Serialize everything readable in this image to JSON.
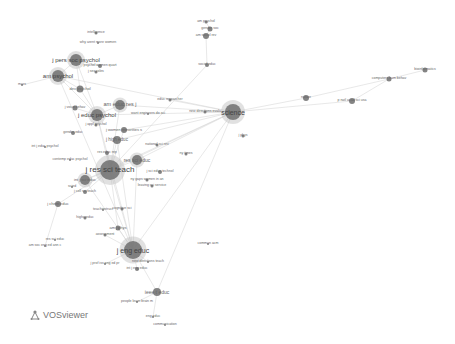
{
  "chart_data": {
    "type": "network",
    "title": "",
    "tool": "VOSviewer",
    "colors": {
      "node": "#6e6e6e",
      "node_light": "#bdbdbd",
      "edge": "#d9d9d9",
      "label": "#555555"
    },
    "nodes": [
      {
        "id": "am_psychol_top",
        "label": "am psychol",
        "x": 206,
        "y": 22,
        "r": 1.5,
        "fs": 3.5
      },
      {
        "id": "gender_soc",
        "label": "gender soc",
        "x": 210,
        "y": 29,
        "r": 2.5,
        "fs": 3.5
      },
      {
        "id": "intelligence",
        "label": "intelligence",
        "x": 96,
        "y": 33,
        "r": 1.5,
        "fs": 3.5
      },
      {
        "id": "am_sociol_rev",
        "label": "am sociol rev",
        "x": 206,
        "y": 36,
        "r": 3,
        "fs": 3.5
      },
      {
        "id": "why_arent_more_women",
        "label": "why arent more women",
        "x": 98,
        "y": 43,
        "r": 1,
        "fs": 3.5
      },
      {
        "id": "j_pers_soc_psychol",
        "label": "j pers soc psychol",
        "x": 76,
        "y": 60,
        "r": 6,
        "fs": 6
      },
      {
        "id": "psychol_women_quart",
        "label": "psychol women quart",
        "x": 100,
        "y": 66,
        "r": 2,
        "fs": 3.5
      },
      {
        "id": "sociol_educ",
        "label": "sociol educ",
        "x": 207,
        "y": 65,
        "r": 2,
        "fs": 3.5
      },
      {
        "id": "sex_roles",
        "label": "j sex roles",
        "x": 96,
        "y": 72,
        "r": 1.5,
        "fs": 3.5
      },
      {
        "id": "am_psychol",
        "label": "am psychol",
        "x": 58,
        "y": 76,
        "r": 6,
        "fs": 6
      },
      {
        "id": "mars",
        "label": "mars",
        "x": 22,
        "y": 85,
        "r": 1,
        "fs": 3.5
      },
      {
        "id": "dev_psychol",
        "label": "dev psychol",
        "x": 80,
        "y": 89,
        "r": 3.5,
        "fs": 4
      },
      {
        "id": "am_educ_res_j",
        "label": "am educ res j",
        "x": 120,
        "y": 105,
        "r": 5,
        "fs": 5.5
      },
      {
        "id": "educ_researcher",
        "label": "educ researcher",
        "x": 170,
        "y": 100,
        "r": 1.5,
        "fs": 3.5
      },
      {
        "id": "science",
        "label": "science",
        "x": 233,
        "y": 112,
        "r": 8,
        "fs": 7
      },
      {
        "id": "j_vocat_behav",
        "label": "j vocat behav",
        "x": 75,
        "y": 108,
        "r": 2.5,
        "fs": 3.5
      },
      {
        "id": "j_educ_psychol",
        "label": "j educ psychol",
        "x": 97,
        "y": 115,
        "r": 6,
        "fs": 6
      },
      {
        "id": "new_directions_eval",
        "label": "new directions evalu",
        "x": 205,
        "y": 112,
        "r": 1.5,
        "fs": 3.5
      },
      {
        "id": "want_engineers_do_sci",
        "label": "want engineers do sci",
        "x": 148,
        "y": 114,
        "r": 1,
        "fs": 3.5
      },
      {
        "id": "j_appl_psychol",
        "label": "j appl psychol",
        "x": 96,
        "y": 125,
        "r": 1.5,
        "fs": 3.5
      },
      {
        "id": "j_women_minorities",
        "label": "j women minorities s",
        "x": 124,
        "y": 130,
        "r": 3,
        "fs": 4
      },
      {
        "id": "gender_educ",
        "label": "gender educ",
        "x": 73,
        "y": 133,
        "r": 2,
        "fs": 3.5
      },
      {
        "id": "j_high_educ",
        "label": "j high educ",
        "x": 117,
        "y": 140,
        "r": 4,
        "fs": 4.5
      },
      {
        "id": "national_sci_rev",
        "label": "national sci rev",
        "x": 157,
        "y": 145,
        "r": 1.5,
        "fs": 3.5
      },
      {
        "id": "int_j_educ_psychol",
        "label": "int j educ psychol",
        "x": 45,
        "y": 147,
        "r": 1,
        "fs": 3.5
      },
      {
        "id": "ny_times",
        "label": "ny times",
        "x": 186,
        "y": 154,
        "r": 1.5,
        "fs": 3.5
      },
      {
        "id": "res_educ_rep",
        "label": "res educ rep",
        "x": 107,
        "y": 153,
        "r": 2,
        "fs": 3.5
      },
      {
        "id": "res_sci_educ",
        "label": "res sci educ",
        "x": 137,
        "y": 160,
        "r": 5,
        "fs": 5
      },
      {
        "id": "contemp_educ_psychol",
        "label": "contemp educ psychol",
        "x": 70,
        "y": 160,
        "r": 1,
        "fs": 3.5
      },
      {
        "id": "j_res_sci_teach",
        "label": "j res sci teach",
        "x": 110,
        "y": 170,
        "r": 10,
        "fs": 8
      },
      {
        "id": "int_j_sci_educ",
        "label": "int j sci educ",
        "x": 85,
        "y": 180,
        "r": 5,
        "fs": 4
      },
      {
        "id": "j_sci_educ_technol",
        "label": "j sci educ technol",
        "x": 160,
        "y": 172,
        "r": 2,
        "fs": 3.5
      },
      {
        "id": "ny_gaps_women",
        "label": "ny gaps women in an",
        "x": 147,
        "y": 180,
        "r": 1.5,
        "fs": 3.5
      },
      {
        "id": "leaving_sci_service",
        "label": "leaving sci service",
        "x": 152,
        "y": 186,
        "r": 1.5,
        "fs": 3.5
      },
      {
        "id": "scied",
        "label": "scied",
        "x": 72,
        "y": 187,
        "r": 1,
        "fs": 3.5
      },
      {
        "id": "j_coll_sci_teach",
        "label": "j coll sci teach",
        "x": 85,
        "y": 192,
        "r": 2,
        "fs": 3.5
      },
      {
        "id": "j_chem_educ",
        "label": "j chem educ",
        "x": 58,
        "y": 204,
        "r": 3,
        "fs": 4
      },
      {
        "id": "teachinstruct",
        "label": "teachinstruct",
        "x": 103,
        "y": 210,
        "r": 1,
        "fs": 3.5
      },
      {
        "id": "cognitive_sci",
        "label": "cognitive sci",
        "x": 122,
        "y": 209,
        "r": 1.5,
        "fs": 3.5
      },
      {
        "id": "highered",
        "label": "highereduc",
        "x": 85,
        "y": 218,
        "r": 1.5,
        "fs": 3.5
      },
      {
        "id": "am_j_phys",
        "label": "am j phys",
        "x": 118,
        "y": 228,
        "r": 2.5,
        "fs": 4
      },
      {
        "id": "assessment",
        "label": "assessment",
        "x": 105,
        "y": 235,
        "r": 1.5,
        "fs": 3.5
      },
      {
        "id": "res_sci_educ2",
        "label": "res sci educ",
        "x": 55,
        "y": 240,
        "r": 1,
        "fs": 3.5
      },
      {
        "id": "am_soc_eng_ed",
        "label": "am soc eng ed ann c",
        "x": 45,
        "y": 246,
        "r": 1,
        "fs": 3.5
      },
      {
        "id": "comment_acm",
        "label": "commun acm",
        "x": 208,
        "y": 244,
        "r": 1,
        "fs": 3.5
      },
      {
        "id": "j_eng_educ",
        "label": "j eng educ",
        "x": 133,
        "y": 250,
        "r": 9,
        "fs": 7
      },
      {
        "id": "j_prof_issues",
        "label": "j prof iss eng ed pr",
        "x": 105,
        "y": 264,
        "r": 1,
        "fs": 3.5
      },
      {
        "id": "new_directions_teach",
        "label": "new directions teach",
        "x": 148,
        "y": 262,
        "r": 1,
        "fs": 3.5
      },
      {
        "id": "int_j_eng_educ",
        "label": "int j eng educ",
        "x": 137,
        "y": 269,
        "r": 2,
        "fs": 3.5
      },
      {
        "id": "ieee_t_educ",
        "label": "ieee t educ",
        "x": 157,
        "y": 292,
        "r": 4,
        "fs": 5
      },
      {
        "id": "people_learn_brain",
        "label": "people learn brain m",
        "x": 137,
        "y": 302,
        "r": 1,
        "fs": 3.5
      },
      {
        "id": "eng_educ",
        "label": "eng educ",
        "x": 153,
        "y": 317,
        "r": 1,
        "fs": 3.5
      },
      {
        "id": "communication",
        "label": "communication",
        "x": 165,
        "y": 325,
        "r": 1,
        "fs": 3.5
      },
      {
        "id": "nature",
        "label": "nature",
        "x": 306,
        "y": 98,
        "r": 3,
        "fs": 3.5
      },
      {
        "id": "p_natl_acad_sci",
        "label": "p natl acad sci usa",
        "x": 352,
        "y": 101,
        "r": 3,
        "fs": 3.5
      },
      {
        "id": "computers_hum_behav",
        "label": "computers hum behav",
        "x": 389,
        "y": 79,
        "r": 2.5,
        "fs": 3.5
      },
      {
        "id": "bioinformatics",
        "label": "bioinformatics",
        "x": 425,
        "y": 70,
        "r": 2.5,
        "fs": 3.5
      },
      {
        "id": "j_phys",
        "label": "j phys",
        "x": 243,
        "y": 136,
        "r": 1.5,
        "fs": 3.5
      }
    ],
    "edges": [
      [
        "science",
        "nature"
      ],
      [
        "nature",
        "computers_hum_behav"
      ],
      [
        "computers_hum_behav",
        "bioinformatics"
      ],
      [
        "science",
        "p_natl_acad_sci"
      ],
      [
        "p_natl_acad_sci",
        "computers_hum_behav"
      ],
      [
        "science",
        "j_res_sci_teach"
      ],
      [
        "science",
        "j_eng_educ"
      ],
      [
        "science",
        "am_educ_res_j"
      ],
      [
        "science",
        "j_educ_psychol"
      ],
      [
        "science",
        "res_sci_educ"
      ],
      [
        "science",
        "j_high_educ"
      ],
      [
        "science",
        "am_psychol"
      ],
      [
        "science",
        "int_j_sci_educ"
      ],
      [
        "science",
        "educ_researcher"
      ],
      [
        "science",
        "new_directions_eval"
      ],
      [
        "science",
        "j_women_minorities"
      ],
      [
        "science",
        "ieee_t_educ"
      ],
      [
        "am_sociol_rev",
        "sociol_educ"
      ],
      [
        "gender_soc",
        "am_sociol_rev"
      ],
      [
        "am_psychol_top",
        "gender_soc"
      ],
      [
        "sociol_educ",
        "j_res_sci_teach"
      ],
      [
        "j_pers_soc_psychol",
        "am_psychol"
      ],
      [
        "j_pers_soc_psychol",
        "dev_psychol"
      ],
      [
        "j_pers_soc_psychol",
        "j_educ_psychol"
      ],
      [
        "j_pers_soc_psychol",
        "psychol_women_quart"
      ],
      [
        "am_psychol",
        "mars"
      ],
      [
        "am_psychol",
        "j_educ_psychol"
      ],
      [
        "am_psychol",
        "dev_psychol"
      ],
      [
        "dev_psychol",
        "j_educ_psychol"
      ],
      [
        "j_educ_psychol",
        "j_res_sci_teach"
      ],
      [
        "am_educ_res_j",
        "j_res_sci_teach"
      ],
      [
        "am_educ_res_j",
        "j_educ_psychol"
      ],
      [
        "j_vocat_behav",
        "j_educ_psychol"
      ],
      [
        "j_res_sci_teach",
        "res_sci_educ"
      ],
      [
        "j_res_sci_teach",
        "int_j_sci_educ"
      ],
      [
        "j_res_sci_teach",
        "j_eng_educ"
      ],
      [
        "j_res_sci_teach",
        "j_high_educ"
      ],
      [
        "j_res_sci_teach",
        "j_women_minorities"
      ],
      [
        "j_res_sci_teach",
        "j_chem_educ"
      ],
      [
        "j_res_sci_teach",
        "res_educ_rep"
      ],
      [
        "j_res_sci_teach",
        "j_coll_sci_teach"
      ],
      [
        "j_res_sci_teach",
        "am_j_phys"
      ],
      [
        "j_eng_educ",
        "ieee_t_educ"
      ],
      [
        "j_eng_educ",
        "int_j_eng_educ"
      ],
      [
        "j_eng_educ",
        "am_j_phys"
      ],
      [
        "j_eng_educ",
        "res_sci_educ"
      ],
      [
        "j_eng_educ",
        "j_high_educ"
      ],
      [
        "j_eng_educ",
        "int_j_sci_educ"
      ],
      [
        "j_eng_educ",
        "new_directions_teach"
      ],
      [
        "j_eng_educ",
        "j_prof_issues"
      ],
      [
        "ieee_t_educ",
        "eng_educ"
      ],
      [
        "ieee_t_educ",
        "people_learn_brain"
      ],
      [
        "j_eng_educ",
        "am_psychol"
      ],
      [
        "j_eng_educ",
        "j_educ_psychol"
      ],
      [
        "j_chem_educ",
        "am_soc_eng_ed"
      ],
      [
        "j_eng_educ",
        "assessment"
      ]
    ],
    "xlabel": "",
    "ylabel": ""
  },
  "logo": {
    "label": "VOSviewer"
  }
}
